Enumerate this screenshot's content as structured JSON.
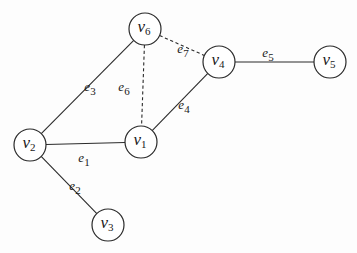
{
  "diagram": {
    "type": "graph",
    "nodes": [
      {
        "id": "v1",
        "base": "v",
        "sub": "1",
        "x": 141,
        "y": 142
      },
      {
        "id": "v2",
        "base": "v",
        "sub": "2",
        "x": 30,
        "y": 145
      },
      {
        "id": "v3",
        "base": "v",
        "sub": "3",
        "x": 108,
        "y": 225
      },
      {
        "id": "v4",
        "base": "v",
        "sub": "4",
        "x": 219,
        "y": 62
      },
      {
        "id": "v5",
        "base": "v",
        "sub": "5",
        "x": 330,
        "y": 62
      },
      {
        "id": "v6",
        "base": "v",
        "sub": "6",
        "x": 145,
        "y": 29
      }
    ],
    "edges": [
      {
        "id": "e1",
        "base": "e",
        "sub": "1",
        "from": "v2",
        "to": "v1",
        "style": "solid",
        "lx": 84,
        "ly": 159
      },
      {
        "id": "e2",
        "base": "e",
        "sub": "2",
        "from": "v2",
        "to": "v3",
        "style": "solid",
        "lx": 75,
        "ly": 187
      },
      {
        "id": "e3",
        "base": "e",
        "sub": "3",
        "from": "v2",
        "to": "v6",
        "style": "solid",
        "lx": 90,
        "ly": 88
      },
      {
        "id": "e4",
        "base": "e",
        "sub": "4",
        "from": "v1",
        "to": "v4",
        "style": "solid",
        "lx": 184,
        "ly": 106
      },
      {
        "id": "e5",
        "base": "e",
        "sub": "5",
        "from": "v4",
        "to": "v5",
        "style": "solid",
        "lx": 268,
        "ly": 54
      },
      {
        "id": "e6",
        "base": "e",
        "sub": "6",
        "from": "v6",
        "to": "v1",
        "style": "dashed",
        "lx": 124,
        "ly": 88
      },
      {
        "id": "e7",
        "base": "e",
        "sub": "7",
        "from": "v6",
        "to": "v4",
        "style": "dashed",
        "lx": 183,
        "ly": 50
      }
    ],
    "node_radius": 16
  }
}
